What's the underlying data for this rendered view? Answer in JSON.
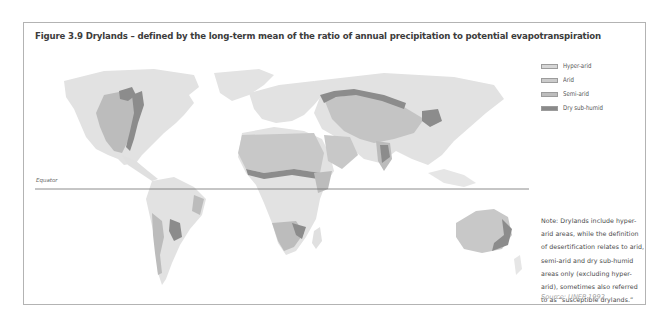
{
  "figure": {
    "title": "Figure 3.9 Drylands – defined by the long-term mean of the ratio of annual precipitation to potential evapotranspiration"
  },
  "map": {
    "equator_label": "Equator",
    "colors": {
      "non_dryland": "#e2e2e2",
      "hyper_arid": "#d3d3d3",
      "arid": "#c8c8c8",
      "semi_arid": "#bcbcbc",
      "dry_sub_humid": "#8c8c8c",
      "equator_line": "#6e6e6e"
    }
  },
  "legend": {
    "items": [
      {
        "label": "Hyper-arid",
        "color": "#d6d6d6"
      },
      {
        "label": "Arid",
        "color": "#cbcbcb"
      },
      {
        "label": "Semi-arid",
        "color": "#bdbdbd"
      },
      {
        "label": "Dry sub-humid",
        "color": "#8a8a8a"
      }
    ]
  },
  "note": {
    "lines": [
      "Note: Drylands include hyper-",
      "arid areas, while the definition",
      "of desertification relates to arid,",
      "semi-arid and dry sub-humid",
      "areas only (excluding hyper-",
      "arid), sometimes also referred",
      "to as “susceptible drylands.”"
    ]
  },
  "source": {
    "text": "Source: UNEP 1992"
  }
}
